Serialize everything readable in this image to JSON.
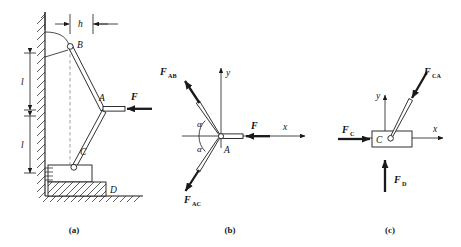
{
  "figure": {
    "background_color": "#ffffff",
    "line_color": "#1a1a1a",
    "dashed_line_color": "#8a8a8a"
  },
  "captions": {
    "a": "(a)",
    "b": "(b)",
    "c": "(c)"
  },
  "panel_a": {
    "name": "assembly-diagram",
    "dimensions": {
      "h": "h",
      "l_upper": "l",
      "l_lower": "l"
    },
    "joints": {
      "b": "B",
      "a": "A",
      "c": "C",
      "d": "D"
    },
    "applied_force": "F"
  },
  "panel_b": {
    "name": "free-body-diagram-joint-a",
    "joint_label": "A",
    "axes": {
      "x": "x",
      "y": "y"
    },
    "angles": {
      "upper": "α",
      "lower": "α"
    },
    "forces": [
      {
        "symbol": "F",
        "subscript": "AB",
        "direction": "up-left"
      },
      {
        "symbol": "F",
        "subscript": "AC",
        "direction": "down-left"
      },
      {
        "symbol": "F",
        "subscript": "",
        "direction": "left"
      }
    ]
  },
  "panel_c": {
    "name": "free-body-diagram-block-c",
    "block_label": "C",
    "axes": {
      "x": "x",
      "y": "y"
    },
    "forces": [
      {
        "symbol": "F",
        "subscript": "CA",
        "direction": "down-left-into-block"
      },
      {
        "symbol": "F",
        "subscript": "C",
        "direction": "right"
      },
      {
        "symbol": "F",
        "subscript": "D",
        "direction": "up"
      }
    ]
  }
}
